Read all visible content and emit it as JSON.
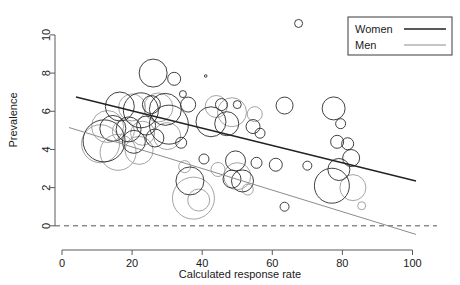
{
  "chart_data": {
    "type": "scatter",
    "subtype": "bubble",
    "title": "",
    "xlabel": "Calculated response rate",
    "ylabel": "Prevalence",
    "xlim": [
      -2,
      103
    ],
    "ylim": [
      -0.9,
      11.2
    ],
    "xticks": [
      0,
      20,
      40,
      60,
      80,
      100
    ],
    "yticks": [
      0,
      2,
      4,
      6,
      8,
      10
    ],
    "xticklabels": [
      "0",
      "20",
      "40",
      "60",
      "80",
      "100"
    ],
    "yticklabels": [
      "0",
      "2",
      "4",
      "6",
      "8",
      "10"
    ],
    "grid": false,
    "legend": {
      "position": "top-right",
      "entries": [
        {
          "name": "Women",
          "color": "#222222",
          "linewidth": 1.5
        },
        {
          "name": "Men",
          "color": "#8c8c8c",
          "linewidth": 1.0
        }
      ]
    },
    "reference_lines": [
      {
        "name": "zero-line",
        "orientation": "horizontal",
        "y": 0,
        "style": "dashed",
        "color": "#555555"
      }
    ],
    "trend_lines": [
      {
        "series": "Women",
        "x0": 4,
        "y0": 6.75,
        "x1": 101,
        "y1": 2.35,
        "color": "#222222",
        "width": 1.4
      },
      {
        "series": "Men",
        "x0": 2,
        "y0": 5.15,
        "x1": 101,
        "y1": -0.45,
        "color": "#8c8c8c",
        "width": 1.0
      }
    ],
    "series": [
      {
        "name": "Women",
        "color": "#2b2b2b",
        "marker": "open-circle",
        "size_units": "bubble-radius-px",
        "points": [
          {
            "x": 67.5,
            "y": 10.6,
            "r": 4.0
          },
          {
            "x": 26.0,
            "y": 8.0,
            "r": 14.0
          },
          {
            "x": 32.0,
            "y": 7.7,
            "r": 6.5
          },
          {
            "x": 34.5,
            "y": 6.9,
            "r": 3.5
          },
          {
            "x": 41.0,
            "y": 7.85,
            "r": 1.3
          },
          {
            "x": 16.5,
            "y": 6.25,
            "r": 14.5
          },
          {
            "x": 22.5,
            "y": 6.05,
            "r": 17.5
          },
          {
            "x": 25.5,
            "y": 6.35,
            "r": 9.0
          },
          {
            "x": 29.5,
            "y": 6.1,
            "r": 16.0
          },
          {
            "x": 36.0,
            "y": 6.35,
            "r": 7.5
          },
          {
            "x": 45.5,
            "y": 6.35,
            "r": 6.0
          },
          {
            "x": 50.0,
            "y": 6.35,
            "r": 4.0
          },
          {
            "x": 63.5,
            "y": 6.3,
            "r": 8.5
          },
          {
            "x": 77.5,
            "y": 6.15,
            "r": 11.5
          },
          {
            "x": 79.5,
            "y": 5.35,
            "r": 5.0
          },
          {
            "x": 14.5,
            "y": 5.1,
            "r": 13.0
          },
          {
            "x": 19.0,
            "y": 5.05,
            "r": 12.5
          },
          {
            "x": 24.0,
            "y": 5.25,
            "r": 9.5
          },
          {
            "x": 30.5,
            "y": 5.3,
            "r": 19.5
          },
          {
            "x": 42.5,
            "y": 5.45,
            "r": 15.0
          },
          {
            "x": 47.0,
            "y": 5.35,
            "r": 12.0
          },
          {
            "x": 54.5,
            "y": 5.2,
            "r": 7.0
          },
          {
            "x": 56.5,
            "y": 4.85,
            "r": 5.0
          },
          {
            "x": 12.0,
            "y": 4.45,
            "r": 21.0
          },
          {
            "x": 20.5,
            "y": 4.4,
            "r": 11.5
          },
          {
            "x": 26.5,
            "y": 4.6,
            "r": 9.0
          },
          {
            "x": 34.0,
            "y": 4.35,
            "r": 5.5
          },
          {
            "x": 78.5,
            "y": 4.4,
            "r": 6.5
          },
          {
            "x": 81.5,
            "y": 4.3,
            "r": 6.0
          },
          {
            "x": 82.5,
            "y": 3.55,
            "r": 8.5
          },
          {
            "x": 40.5,
            "y": 3.5,
            "r": 5.0
          },
          {
            "x": 49.5,
            "y": 3.4,
            "r": 10.0
          },
          {
            "x": 55.5,
            "y": 3.3,
            "r": 5.5
          },
          {
            "x": 61.0,
            "y": 3.2,
            "r": 6.5
          },
          {
            "x": 70.0,
            "y": 3.15,
            "r": 4.5
          },
          {
            "x": 79.0,
            "y": 2.95,
            "r": 11.0
          },
          {
            "x": 36.5,
            "y": 2.35,
            "r": 14.0
          },
          {
            "x": 48.5,
            "y": 2.45,
            "r": 9.0
          },
          {
            "x": 51.5,
            "y": 2.35,
            "r": 11.0
          },
          {
            "x": 77.0,
            "y": 2.1,
            "r": 17.5
          },
          {
            "x": 63.5,
            "y": 1.0,
            "r": 4.5
          }
        ]
      },
      {
        "name": "Men",
        "color": "#9a9a9a",
        "marker": "open-circle",
        "size_units": "bubble-radius-px",
        "points": [
          {
            "x": 20.0,
            "y": 6.2,
            "r": 13.5
          },
          {
            "x": 27.5,
            "y": 6.2,
            "r": 14.5
          },
          {
            "x": 44.0,
            "y": 6.25,
            "r": 11.0
          },
          {
            "x": 48.5,
            "y": 5.95,
            "r": 14.5
          },
          {
            "x": 55.0,
            "y": 5.85,
            "r": 7.5
          },
          {
            "x": 13.0,
            "y": 5.2,
            "r": 16.0
          },
          {
            "x": 17.5,
            "y": 4.95,
            "r": 11.0
          },
          {
            "x": 23.0,
            "y": 4.85,
            "r": 12.0
          },
          {
            "x": 30.0,
            "y": 4.7,
            "r": 13.5
          },
          {
            "x": 11.0,
            "y": 4.3,
            "r": 19.0
          },
          {
            "x": 16.0,
            "y": 3.85,
            "r": 18.0
          },
          {
            "x": 22.0,
            "y": 3.95,
            "r": 14.0
          },
          {
            "x": 35.0,
            "y": 3.1,
            "r": 6.0
          },
          {
            "x": 44.5,
            "y": 2.95,
            "r": 7.0
          },
          {
            "x": 50.0,
            "y": 2.6,
            "r": 13.5
          },
          {
            "x": 53.0,
            "y": 1.9,
            "r": 5.5
          },
          {
            "x": 37.5,
            "y": 1.45,
            "r": 21.0
          },
          {
            "x": 39.0,
            "y": 1.35,
            "r": 11.0
          },
          {
            "x": 83.0,
            "y": 2.0,
            "r": 13.0
          },
          {
            "x": 85.5,
            "y": 1.05,
            "r": 4.0
          }
        ]
      }
    ]
  },
  "legend": {
    "women_label": "Women",
    "men_label": "Men"
  },
  "axis": {
    "x_title": "Calculated response rate",
    "y_title": "Prevalence"
  }
}
